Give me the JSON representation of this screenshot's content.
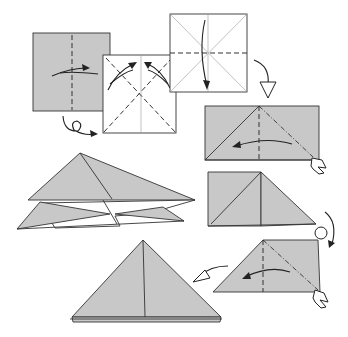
{
  "diagram": {
    "colors": {
      "paper_colored": "#c8c8c8",
      "paper_white": "#ffffff",
      "line": "#333333"
    },
    "steps": [
      {
        "id": 1,
        "description": "Colored square with vertical valley fold; fold in half and unfold",
        "symbols": [
          "valley-fold",
          "fold-unfold-arrow",
          "turn-over-symbol"
        ]
      },
      {
        "id": 2,
        "description": "White side square with diagonal valley folds; fold and unfold both diagonals",
        "symbols": [
          "valley-fold",
          "fold-unfold-arrow"
        ]
      },
      {
        "id": 3,
        "description": "White square with diagonal creases and horizontal valley fold; fold top down",
        "symbols": [
          "valley-fold",
          "fold-arrow"
        ]
      },
      {
        "id": 4,
        "description": "Rectangle with vertical valley and mountain fold; squash fold",
        "symbols": [
          "valley-fold",
          "mountain-fold",
          "push-arrow"
        ]
      },
      {
        "id": 5,
        "description": "Intermediate folded shape; turn over",
        "symbols": [
          "turn-over-symbol"
        ]
      },
      {
        "id": 6,
        "description": "Repeat squash fold on the other side",
        "symbols": [
          "valley-fold",
          "mountain-fold",
          "push-arrow"
        ]
      },
      {
        "id": 7,
        "description": "Completed triangle (waterbomb base)",
        "symbols": [
          "result-arrow"
        ]
      },
      {
        "id": 8,
        "description": "Opening the layers (3D view)",
        "symbols": []
      }
    ]
  }
}
